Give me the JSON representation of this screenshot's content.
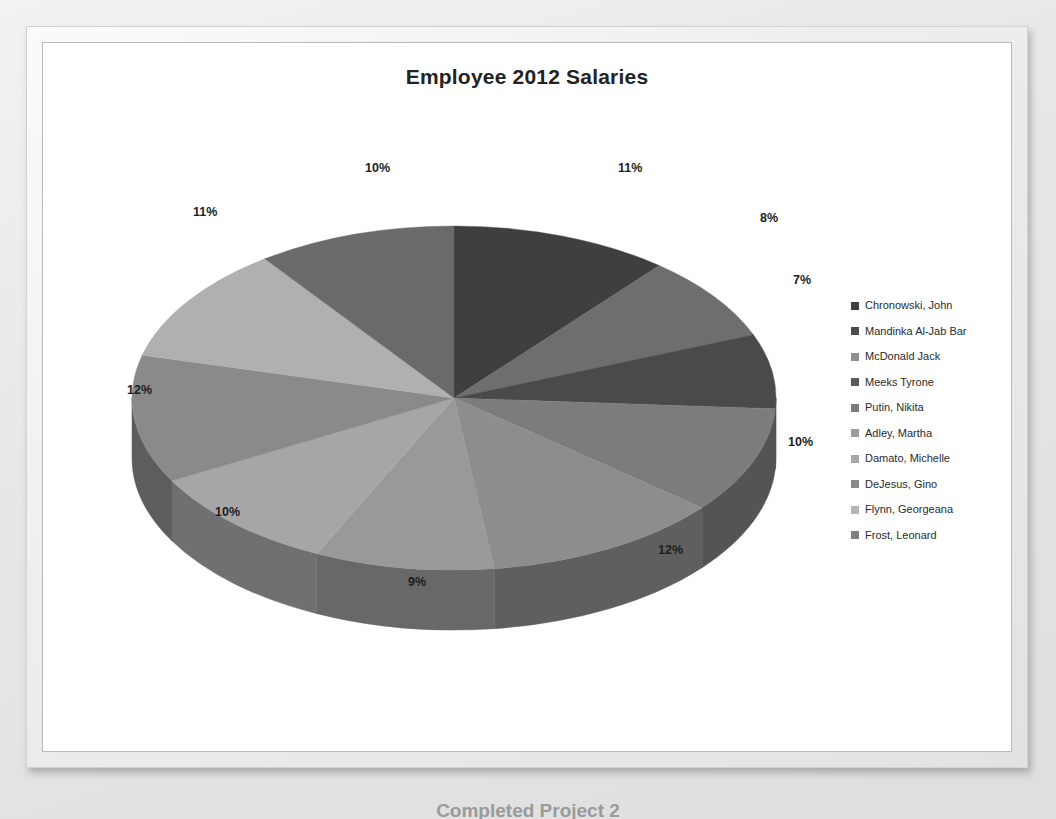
{
  "slide": {
    "caption": "Completed Project 2"
  },
  "chart": {
    "title": "Employee 2012 Salaries"
  },
  "chart_data": {
    "type": "pie",
    "title": "Employee 2012 Salaries",
    "xlabel": "",
    "ylabel": "",
    "legend_position": "right",
    "grid": false,
    "style": "3d-pie",
    "data_labels": "percentage",
    "categories": [
      "Chronowski, John",
      "Mandinka  Al-Jab Bar",
      "McDonald Jack",
      "Meeks Tyrone",
      "Putin, Nikita",
      "Adley, Martha",
      "Damato, Michelle",
      "DeJesus, Gino",
      "Flynn, Georgeana",
      "Frost, Leonard"
    ],
    "values": [
      11,
      8,
      7,
      10,
      12,
      9,
      10,
      12,
      11,
      10
    ],
    "labels": [
      "11%",
      "8%",
      "7%",
      "10%",
      "12%",
      "9%",
      "10%",
      "12%",
      "11%",
      "10%"
    ],
    "colors": [
      "#3f3f3f",
      "#6e6e6e",
      "#4a4a4a",
      "#7c7c7c",
      "#8d8d8d",
      "#999999",
      "#a6a6a6",
      "#8a8a8a",
      "#b0b0b0",
      "#6a6a6a"
    ],
    "side_colors": [
      "#2a2a2a",
      "#4a4a4a",
      "#323232",
      "#545454",
      "#5f5f5f",
      "#686868",
      "#707070",
      "#5d5d5d",
      "#777777",
      "#474747"
    ]
  },
  "legend": {
    "items": [
      {
        "label": "Chronowski, John",
        "color": "#3f3f3f"
      },
      {
        "label": "Mandinka  Al-Jab Bar",
        "color": "#4d4d4d"
      },
      {
        "label": "McDonald Jack",
        "color": "#8f8f8f"
      },
      {
        "label": "Meeks Tyrone",
        "color": "#5a5a5a"
      },
      {
        "label": "Putin, Nikita",
        "color": "#7a7a7a"
      },
      {
        "label": "Adley, Martha",
        "color": "#9c9c9c"
      },
      {
        "label": "Damato, Michelle",
        "color": "#a8a8a8"
      },
      {
        "label": "DeJesus, Gino",
        "color": "#8a8a8a"
      },
      {
        "label": "Flynn, Georgeana",
        "color": "#b5b5b5"
      },
      {
        "label": "Frost, Leonard",
        "color": "#7f7f7f"
      }
    ]
  },
  "pct_labels": [
    {
      "text": "11%",
      "left": 535,
      "top": 8
    },
    {
      "text": "8%",
      "left": 677,
      "top": 58
    },
    {
      "text": "7%",
      "left": 710,
      "top": 120
    },
    {
      "text": "10%",
      "left": 705,
      "top": 282
    },
    {
      "text": "12%",
      "left": 575,
      "top": 390
    },
    {
      "text": "9%",
      "left": 325,
      "top": 422
    },
    {
      "text": "10%",
      "left": 132,
      "top": 352
    },
    {
      "text": "12%",
      "left": 44,
      "top": 230
    },
    {
      "text": "11%",
      "left": 110,
      "top": 52
    },
    {
      "text": "10%",
      "left": 282,
      "top": 8
    }
  ]
}
